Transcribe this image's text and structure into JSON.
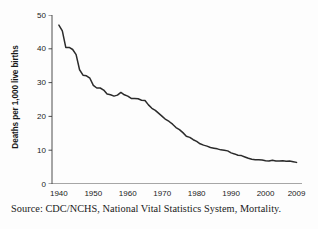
{
  "chart_data": {
    "type": "line",
    "title": "",
    "subtitle": "",
    "xlabel": "",
    "ylabel": "Deaths per 1,000 live births",
    "xlim": [
      1938,
      2010
    ],
    "ylim": [
      0,
      50
    ],
    "grid": false,
    "legend": null,
    "legend_position": "none",
    "line_color": "#2b2b2b",
    "yticks": [
      0,
      10,
      20,
      30,
      40,
      50
    ],
    "ytick_labels": [
      "0",
      "10",
      "20",
      "30",
      "40",
      "50"
    ],
    "xticks": [
      1940,
      1950,
      1960,
      1970,
      1980,
      1990,
      2000,
      2009
    ],
    "xtick_labels": [
      "1940",
      "1950",
      "1960",
      "1970",
      "1980",
      "1990",
      "2000",
      "2009"
    ],
    "series": [
      {
        "name": "Infant mortality rate",
        "x": [
          1940,
          1941,
          1942,
          1943,
          1944,
          1945,
          1946,
          1947,
          1948,
          1949,
          1950,
          1951,
          1952,
          1953,
          1954,
          1955,
          1956,
          1957,
          1958,
          1959,
          1960,
          1961,
          1962,
          1963,
          1964,
          1965,
          1966,
          1967,
          1968,
          1969,
          1970,
          1971,
          1972,
          1973,
          1974,
          1975,
          1976,
          1977,
          1978,
          1979,
          1980,
          1981,
          1982,
          1983,
          1984,
          1985,
          1986,
          1987,
          1988,
          1989,
          1990,
          1991,
          1992,
          1993,
          1994,
          1995,
          1996,
          1997,
          1998,
          1999,
          2000,
          2001,
          2002,
          2003,
          2004,
          2005,
          2006,
          2007,
          2008,
          2009
        ],
        "y": [
          47.0,
          45.3,
          40.4,
          40.4,
          39.8,
          38.3,
          33.8,
          32.2,
          32.0,
          31.3,
          29.2,
          28.4,
          28.4,
          27.8,
          26.6,
          26.4,
          26.0,
          26.3,
          27.1,
          26.4,
          26.0,
          25.3,
          25.3,
          25.2,
          24.8,
          24.7,
          23.4,
          22.4,
          21.8,
          20.9,
          20.0,
          19.1,
          18.5,
          17.7,
          16.7,
          16.1,
          15.2,
          14.1,
          13.8,
          13.1,
          12.6,
          11.9,
          11.5,
          11.2,
          10.8,
          10.6,
          10.4,
          10.1,
          10.0,
          9.8,
          9.2,
          8.9,
          8.5,
          8.4,
          8.0,
          7.6,
          7.3,
          7.2,
          7.2,
          7.1,
          6.9,
          6.8,
          7.0,
          6.8,
          6.8,
          6.9,
          6.7,
          6.8,
          6.6,
          6.4
        ],
        "color": "#2b2b2b"
      }
    ]
  },
  "caption": {
    "source_text": "Source: CDC/NCHS, National Vital Statistics System, Mortality."
  }
}
